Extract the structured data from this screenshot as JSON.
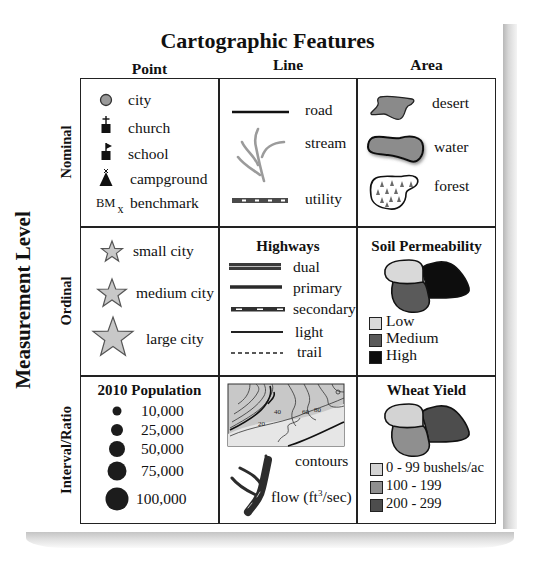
{
  "title": "Cartographic Features",
  "columns": [
    "Point",
    "Line",
    "Area"
  ],
  "axis_label": "Measurement Level",
  "rows": [
    "Nominal",
    "Ordinal",
    "Interval/Ratio"
  ],
  "nominal": {
    "point": [
      {
        "icon": "city-circle-icon",
        "label": "city"
      },
      {
        "icon": "church-icon",
        "label": "church"
      },
      {
        "icon": "school-icon",
        "label": "school"
      },
      {
        "icon": "campground-icon",
        "label": "campground"
      },
      {
        "icon": "benchmark-icon",
        "symbol": "BM",
        "subscript": "x",
        "label": "benchmark"
      }
    ],
    "line": [
      {
        "icon": "road-line-icon",
        "label": "road"
      },
      {
        "icon": "stream-line-icon",
        "label": "stream"
      },
      {
        "icon": "utility-line-icon",
        "label": "utility"
      }
    ],
    "area": [
      {
        "icon": "desert-area-icon",
        "label": "desert"
      },
      {
        "icon": "water-area-icon",
        "label": "water"
      },
      {
        "icon": "forest-area-icon",
        "label": "forest"
      }
    ]
  },
  "ordinal": {
    "point": [
      {
        "icon": "star-small-icon",
        "label": "small city"
      },
      {
        "icon": "star-medium-icon",
        "label": "medium city"
      },
      {
        "icon": "star-large-icon",
        "label": "large city"
      }
    ],
    "line": {
      "title": "Highways",
      "items": [
        {
          "icon": "dual-highway-icon",
          "label": "dual"
        },
        {
          "icon": "primary-highway-icon",
          "label": "primary"
        },
        {
          "icon": "secondary-highway-icon",
          "label": "secondary"
        },
        {
          "icon": "light-highway-icon",
          "label": "light"
        },
        {
          "icon": "trail-icon",
          "label": "trail"
        }
      ]
    },
    "area": {
      "title": "Soil Permeability",
      "legend": [
        {
          "label": "Low",
          "color": "#d9d9d9"
        },
        {
          "label": "Medium",
          "color": "#5a5a5a"
        },
        {
          "label": "High",
          "color": "#0d0d0d"
        }
      ]
    }
  },
  "interval": {
    "point": {
      "title": "2010 Population",
      "items": [
        {
          "label": "10,000",
          "radius": 4.5
        },
        {
          "label": "25,000",
          "radius": 6
        },
        {
          "label": "50,000",
          "radius": 8
        },
        {
          "label": "75,000",
          "radius": 9.5
        },
        {
          "label": "100,000",
          "radius": 11.5
        }
      ],
      "color": "#1c1c1c"
    },
    "line": [
      {
        "icon": "contour-map-icon",
        "label": "contours",
        "contour_labels": [
          "20",
          "40",
          "60",
          "80"
        ]
      },
      {
        "icon": "flow-stream-icon",
        "label": "flow (ft",
        "superscript": "3",
        "suffix": "/sec)"
      }
    ],
    "area": {
      "title": "Wheat Yield",
      "legend": [
        {
          "label": "0 - 99 bushels/ac",
          "color": "#d3d3d3"
        },
        {
          "label": "100 - 199",
          "color": "#8f8f8f"
        },
        {
          "label": "200 - 299",
          "color": "#4d4d4d"
        }
      ]
    }
  }
}
